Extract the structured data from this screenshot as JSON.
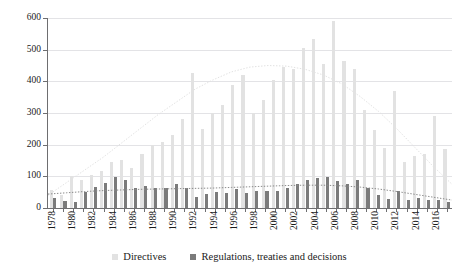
{
  "chart_data": {
    "type": "bar",
    "title": "",
    "subtitle": "",
    "xlabel": "",
    "ylabel": "",
    "ylim": [
      0,
      600
    ],
    "yticks": [
      0,
      100,
      200,
      300,
      400,
      500,
      600
    ],
    "grid": true,
    "legend_position": "bottom",
    "categories": [
      "1978",
      "1979",
      "1980",
      "1981",
      "1982",
      "1983",
      "1984",
      "1985",
      "1986",
      "1987",
      "1988",
      "1989",
      "1990",
      "1991",
      "1992",
      "1993",
      "1994",
      "1995",
      "1996",
      "1997",
      "1998",
      "1999",
      "2000",
      "2001",
      "2002",
      "2003",
      "2004",
      "2005",
      "2006",
      "2007",
      "2008",
      "2009",
      "2010",
      "2011",
      "2012",
      "2013",
      "2014",
      "2015",
      "2016",
      "2017"
    ],
    "xtick_labels": [
      "1978",
      "1980",
      "1982",
      "1984",
      "1986",
      "1988",
      "1990",
      "1992",
      "1994",
      "1996",
      "1998",
      "2000",
      "2002",
      "2004",
      "2006",
      "2008",
      "2010",
      "2012",
      "2014",
      "2016"
    ],
    "series": [
      {
        "name": "Directives",
        "color": "#e2e2e2",
        "values": [
          58,
          40,
          101,
          88,
          103,
          116,
          145,
          152,
          126,
          170,
          200,
          210,
          230,
          280,
          425,
          250,
          300,
          325,
          390,
          420,
          300,
          340,
          405,
          445,
          440,
          505,
          535,
          455,
          590,
          465,
          440,
          310,
          245,
          190,
          370,
          145,
          165,
          170,
          290,
          185
        ]
      },
      {
        "name": "Regulations, treaties and decisions",
        "color": "#7b7b7b",
        "values": [
          33,
          22,
          19,
          50,
          66,
          78,
          99,
          87,
          62,
          68,
          64,
          63,
          76,
          62,
          35,
          44,
          49,
          46,
          60,
          47,
          53,
          55,
          54,
          63,
          76,
          90,
          95,
          98,
          85,
          76,
          90,
          62,
          41,
          27,
          55,
          25,
          32,
          26,
          24,
          19
        ]
      }
    ],
    "trendlines": [
      {
        "name": "Directives trend",
        "style": "dotted",
        "color": "#e2e2e2",
        "points": [
          40,
          80,
          120,
          160,
          205,
          250,
          295,
          335,
          375,
          405,
          430,
          445,
          450,
          448,
          438,
          420,
          392,
          352,
          305,
          250,
          190,
          130,
          75
        ]
      },
      {
        "name": "Regulations trend",
        "style": "dotted",
        "color": "#8a8a8a",
        "points": [
          44,
          48,
          52,
          55,
          57,
          59,
          60,
          61,
          62,
          63,
          65,
          67,
          69,
          71,
          72,
          72,
          70,
          66,
          60,
          52,
          43,
          34,
          25
        ]
      }
    ]
  },
  "legend": {
    "items": [
      {
        "label": "Directives",
        "swatch": "directives"
      },
      {
        "label": "Regulations, treaties and decisions",
        "swatch": "regulations"
      }
    ]
  }
}
